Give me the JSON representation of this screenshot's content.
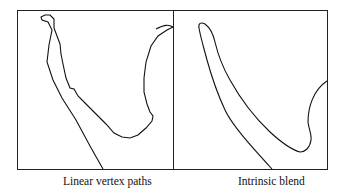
{
  "panels": [
    {
      "id": "left",
      "caption": "Linear vertex paths"
    },
    {
      "id": "right",
      "caption": "Intrinsic blend"
    }
  ],
  "colors": {
    "stroke": "#111111",
    "background": "#ffffff"
  }
}
